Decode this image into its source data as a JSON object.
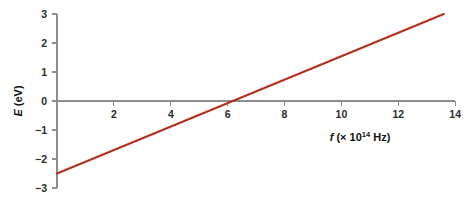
{
  "figure": {
    "clipped_top_caption": "",
    "background_color": "#ffffff"
  },
  "chart_data": {
    "type": "line",
    "title": "",
    "subtitle": "",
    "xlabel": "f (× 10¹⁴ Hz)",
    "xlabel_parts": {
      "symbol": "f",
      "open": "(× 10",
      "exponent": "14",
      "unit": " Hz)"
    },
    "ylabel": "E (eV)",
    "ylabel_parts": {
      "symbol": "E",
      "unit": "(eV)"
    },
    "xlim": [
      0,
      14.35
    ],
    "ylim": [
      -3,
      3.25
    ],
    "xticks": [
      2,
      4,
      6,
      8,
      10,
      12,
      14
    ],
    "xtick_labels": [
      "2",
      "4",
      "6",
      "8",
      "10",
      "12",
      "14"
    ],
    "yticks": [
      3,
      2,
      1,
      0,
      -1,
      -2,
      -3
    ],
    "ytick_labels": [
      "3",
      "2",
      "1",
      "0",
      "−1",
      "−2",
      "−3"
    ],
    "grid": false,
    "legend": false,
    "legend_position": "none",
    "zero_line": true,
    "series": [
      {
        "name": "Photoelectron energy",
        "color": "#b3301f",
        "x": [
          0,
          13.6
        ],
        "y": [
          -2.5,
          3.0
        ],
        "slope": 0.404,
        "intercept": -2.5,
        "x_intercept": 6.2
      }
    ],
    "annotations": []
  }
}
